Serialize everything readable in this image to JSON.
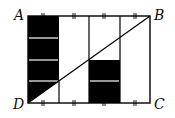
{
  "diagram": {
    "type": "geometry-figure",
    "vertices": {
      "A": {
        "label": "A"
      },
      "B": {
        "label": "B"
      },
      "C": {
        "label": "C"
      },
      "D": {
        "label": "D"
      }
    },
    "colors": {
      "fill": "#000000",
      "line": "#000000",
      "background": "#ffffff"
    }
  }
}
